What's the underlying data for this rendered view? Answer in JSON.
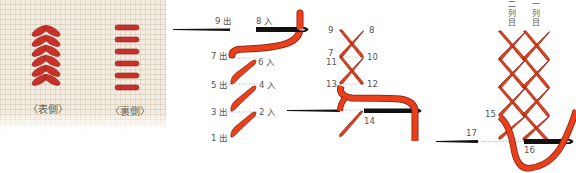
{
  "photo": {
    "captions": {
      "front": "〈表側〉",
      "back": "〈裏側〉"
    },
    "thread_color": "#c8302a",
    "fabric_color": "#f3ece0"
  },
  "diagram1": {
    "labels": {
      "p9": "9 出",
      "p8": "8 入",
      "p7": "7 出",
      "p6": "6 入",
      "p5": "5 出",
      "p4": "4 入",
      "p3": "3 出",
      "p2": "2 入",
      "p1": "1 出"
    }
  },
  "diagram2": {
    "labels": {
      "p9": "9",
      "p8": "8",
      "p7": "7",
      "p10": "10",
      "p11": "11",
      "p13": "13",
      "p12": "12",
      "p14": "14"
    }
  },
  "diagram3": {
    "column_labels": {
      "second": "二列目",
      "first": "一列目"
    },
    "labels": {
      "p15": "15",
      "p16": "16",
      "p17": "17"
    }
  },
  "colors": {
    "thread": "#e8401c",
    "thread_outline": "#8a1c08",
    "needle": "#111111",
    "guide_dots": "#999999"
  }
}
